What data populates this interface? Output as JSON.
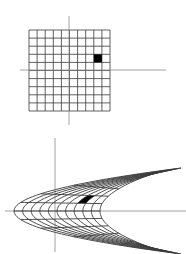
{
  "figure": {
    "colors": {
      "background": "#ffffff",
      "axis": "#8a8a8a",
      "grid": "#3a3a3a",
      "highlight": "#000000"
    },
    "top_panel": {
      "name": "z-plane grid",
      "axes": {
        "horizontal": {
          "x1": 20,
          "x2": 166,
          "y": 70
        },
        "vertical": {
          "x": 69,
          "y1": 16,
          "y2": 125
        }
      },
      "grid": {
        "left": 29,
        "top": 30,
        "cell": 8.1,
        "cols": 10,
        "rows": 10
      },
      "highlight_cell": {
        "col": 8,
        "row": 3
      }
    },
    "bottom_panel": {
      "name": "w-plane image",
      "axes": {
        "horizontal": {
          "x1": 5,
          "x2": 186,
          "y": 211
        },
        "vertical": {
          "x": 55,
          "y1": 138,
          "y2": 252
        }
      },
      "curves": {
        "count_t": 11,
        "count_s": 11,
        "vertex_outer_x": 14,
        "vertex_inner_x": 100,
        "tip_outer_x": 181,
        "tip_inner_x": 152,
        "half_height_outer": 43,
        "half_height_inner": 37
      },
      "highlight_cell": {
        "t_index": 7,
        "s_index": 3
      }
    }
  }
}
